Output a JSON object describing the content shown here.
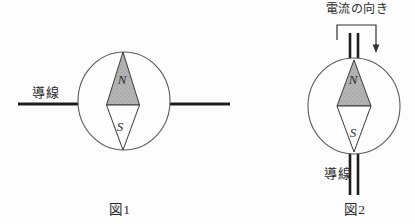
{
  "diagram_title": "compass-and-wire-current-experiment",
  "colors": {
    "background": "#fdfdfd",
    "outline": "#3a3a3a",
    "circle_stroke": "#5a5a5a",
    "wire": "#1c1c1c",
    "needle_north_fill": "#b5b5b5",
    "needle_south_fill": "#fdfdfd",
    "text": "#2b2b2b"
  },
  "fig1": {
    "caption": "図1",
    "wire_label": "導線",
    "north_label": "N",
    "south_label": "S"
  },
  "fig2": {
    "caption": "図2",
    "wire_label": "導線",
    "current_direction_label": "電流の向き",
    "north_label": "N",
    "south_label": "S"
  }
}
